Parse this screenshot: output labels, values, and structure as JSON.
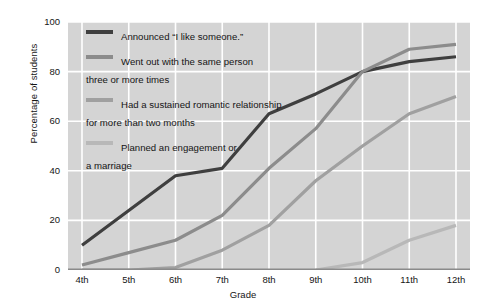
{
  "chart_data": {
    "type": "line",
    "title": "",
    "xlabel": "Grade",
    "ylabel": "Percentage of students",
    "categories": [
      "4th",
      "5th",
      "6th",
      "7th",
      "8th",
      "9th",
      "10th",
      "11th",
      "12th"
    ],
    "ylim": [
      0,
      100
    ],
    "yticks": [
      0,
      20,
      40,
      60,
      80,
      100
    ],
    "grid": true,
    "legend_position": "upper-left-inside",
    "series": [
      {
        "name": "Announced \"I like someone.\"",
        "color": "#3f3f3f",
        "values": [
          10,
          24,
          38,
          41,
          63,
          71,
          80,
          84,
          86
        ]
      },
      {
        "name": "Went out with the same person\nthree or more times",
        "color": "#8c8c8c",
        "values": [
          2,
          7,
          12,
          22,
          41,
          57,
          80,
          89,
          91
        ]
      },
      {
        "name": "Had a sustained romantic relationship\nfor more than two months",
        "color": "#a0a0a0",
        "values": [
          0,
          0,
          1,
          8,
          18,
          36,
          50,
          63,
          70
        ]
      },
      {
        "name": "Planned an engagement or\na marriage",
        "color": "#b8b8b8",
        "values": [
          null,
          null,
          null,
          null,
          null,
          0,
          3,
          12,
          18
        ]
      }
    ]
  },
  "axis": {
    "y_title": "Percentage of students",
    "x_title": "Grade",
    "y_ticks": [
      "100",
      "80",
      "60",
      "40",
      "20",
      "0"
    ],
    "x_ticks": [
      "4th",
      "5th",
      "6th",
      "7th",
      "8th",
      "9th",
      "10th",
      "11th",
      "12th"
    ]
  },
  "legend": {
    "items": [
      {
        "label": "Announced “I like someone.”",
        "color": "#3f3f3f"
      },
      {
        "label": "Went out with the same person\nthree or more times",
        "color": "#8c8c8c"
      },
      {
        "label": "Had a sustained romantic relationship\nfor more than two months",
        "color": "#a0a0a0"
      },
      {
        "label": "Planned an engagement or\na marriage",
        "color": "#b8b8b8"
      }
    ]
  },
  "colors": {
    "plot_background": "#d4d4d4",
    "gridline": "#ffffff",
    "axis_line": "#8a8a8a",
    "text": "#161616"
  }
}
